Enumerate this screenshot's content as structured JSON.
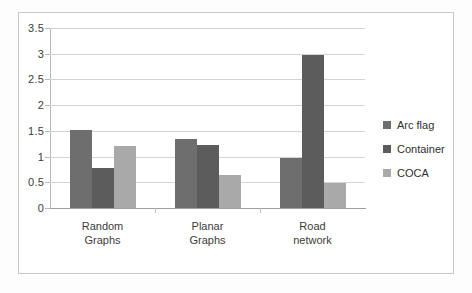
{
  "chart_data": {
    "type": "bar",
    "title": "",
    "subtitle": "",
    "xlabel": "",
    "ylabel": "",
    "categories": [
      "Random Graphs",
      "Planar Graphs",
      "Road network"
    ],
    "category_lines": [
      [
        "Random",
        "Graphs"
      ],
      [
        "Planar",
        "Graphs"
      ],
      [
        "Road",
        "network"
      ]
    ],
    "series": [
      {
        "name": "Arc flag",
        "color": "#6e6e6e",
        "values": [
          1.52,
          1.35,
          0.98
        ]
      },
      {
        "name": "Container",
        "color": "#5c5c5c",
        "values": [
          0.78,
          1.23,
          2.98
        ]
      },
      {
        "name": "COCA",
        "color": "#a9a9a9",
        "values": [
          1.21,
          0.65,
          0.48
        ]
      }
    ],
    "ylim": [
      0,
      3.5
    ],
    "y_ticks": [
      0,
      0.5,
      1,
      1.5,
      2,
      2.5,
      3,
      3.5
    ],
    "y_tick_labels": [
      "0",
      "0.5",
      "1",
      "1.5",
      "2",
      "2.5",
      "3",
      "3.5"
    ],
    "grid": true,
    "grid_axis": "y",
    "legend": true,
    "legend_position": "right",
    "legend_entries": [
      "Arc flag",
      "Container",
      "COCA"
    ],
    "bar_layout": "grouped-adjacent",
    "frame": true
  }
}
